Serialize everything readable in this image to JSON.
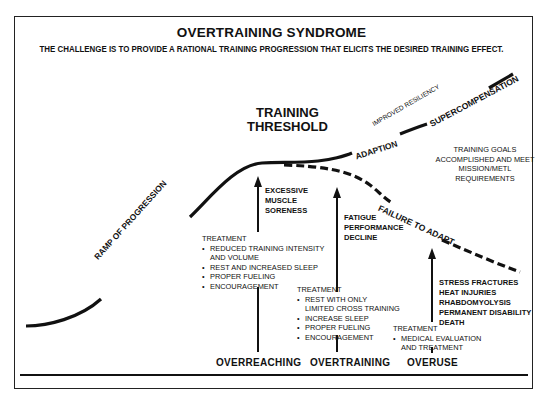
{
  "header": {
    "title": "OVERTRAINING SYNDROME",
    "subtitle": "THE CHALLENGE IS TO PROVIDE A RATIONAL TRAINING PROGRESSION THAT ELICITS THE DESIRED TRAINING EFFECT."
  },
  "threshold": {
    "line1": "TRAINING",
    "line2": "THRESHOLD"
  },
  "curve_labels": {
    "ramp": "RAMP OF PROGRESSION",
    "adaption": "ADAPTION",
    "improved_resiliency": "IMPROVED RESILIENCY",
    "supercompensation": "SUPERCOMPENSATION",
    "failure": "FAILURE TO ADAPT"
  },
  "goals": {
    "lines": [
      "TRAINING GOALS",
      "ACCOMPLISHED AND MEET",
      "MISSION/METL",
      "REQUIREMENTS"
    ]
  },
  "stages": [
    {
      "name": "OVERREACHING",
      "symptoms": [
        "EXCESSIVE",
        "MUSCLE",
        "SORENESS"
      ],
      "treatment_label": "TREATMENT",
      "treatments": [
        "REDUCED TRAINING INTENSITY",
        "REST AND INCREASED SLEEP",
        "PROPER FUELING",
        "ENCOURAGEMENT"
      ],
      "treatment_cont": "AND VOLUME"
    },
    {
      "name": "OVERTRAINING",
      "symptoms": [
        "FATIGUE",
        "PERFORMANCE",
        "DECLINE"
      ],
      "treatment_label": "TREATMENT",
      "treatments": [
        "REST WITH ONLY",
        "INCREASE SLEEP",
        "PROPER FUELING",
        "ENCOURAGEMENT"
      ],
      "treatment_cont": "LIMITED CROSS TRAINING"
    },
    {
      "name": "OVERUSE",
      "symptoms": [
        "STRESS FRACTURES",
        "HEAT INJURIES",
        "RHABDOMYOLYSIS",
        "PERMANENT DISABILITY",
        "DEATH"
      ],
      "treatment_label": "TREATMENT",
      "treatments": [
        "MEDICAL EVALUATION"
      ],
      "treatment_cont": "AND TREATMENT"
    }
  ],
  "colors": {
    "ink": "#111111",
    "background": "#ffffff"
  }
}
